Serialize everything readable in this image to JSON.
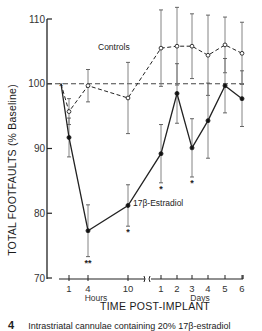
{
  "chart_data": {
    "type": "line",
    "title": "",
    "xlabel": "TIME POST-IMPLANT",
    "ylabel": "TOTAL FOOTFAULTS (% Baseline)",
    "ylim": [
      70,
      110
    ],
    "yticks": [
      70,
      80,
      90,
      100,
      110
    ],
    "x_segments": [
      {
        "unit": "Hours",
        "ticks": [
          "1",
          "4",
          "10"
        ]
      },
      {
        "unit": "Days",
        "ticks": [
          "1",
          "2",
          "3",
          "4",
          "5",
          "6"
        ]
      }
    ],
    "x": [
      "0",
      "1h",
      "4h",
      "10h",
      "1d",
      "2d",
      "3d",
      "4d",
      "5d",
      "6d"
    ],
    "baseline": 100,
    "grid": false,
    "series": [
      {
        "name": "Controls",
        "marker": "open-circle",
        "line": "dashed",
        "values": [
          100,
          95.7,
          99.7,
          97.8,
          105.5,
          105.8,
          105.8,
          104.4,
          106.0,
          104.7
        ],
        "error": [
          0,
          2.0,
          2.5,
          5.5,
          5.9,
          6.0,
          5.0,
          6.2,
          4.3,
          4.8
        ],
        "annotations": []
      },
      {
        "name": "17β-Estradiol",
        "marker": "filled-circle",
        "line": "solid",
        "values": [
          100,
          91.7,
          77.3,
          81.2,
          89.2,
          98.5,
          90.1,
          94.3,
          99.7,
          97.7
        ],
        "error": [
          0,
          3.0,
          4.0,
          3.2,
          4.5,
          4.6,
          4.5,
          5.8,
          4.2,
          4.3
        ],
        "annotations": [
          "",
          "",
          "**",
          "*",
          "*",
          "",
          "*",
          "",
          "",
          ""
        ]
      }
    ],
    "legend": [
      {
        "label": "Controls",
        "position": "near controls line, upper middle"
      },
      {
        "label": "17β-Estradiol",
        "position": "near estradiol line, center"
      }
    ]
  },
  "labels": {
    "ylabel": "TOTAL FOOTFAULTS (% Baseline)",
    "xlabel": "TIME POST-IMPLANT",
    "hours": "Hours",
    "days": "Days",
    "controls": "Controls",
    "estradiol": "17β-Estradiol"
  },
  "caption": {
    "figure_number": "4",
    "text": "Intrastriatal cannulae containing 20% 17β-estradiol"
  }
}
